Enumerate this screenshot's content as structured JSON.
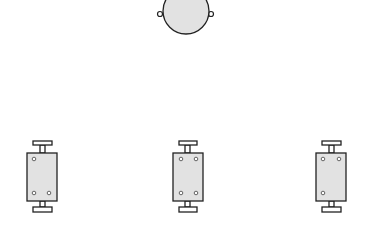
{
  "canvas": {
    "width": 371,
    "height": 227,
    "background": "#ffffff"
  },
  "colors": {
    "stroke": "#222222",
    "fill": "#e2e2e2",
    "hole_fill": "#ffffff"
  },
  "round_component": {
    "icon": "round-fixture-icon",
    "cx": 186,
    "cy": 11,
    "r": 23,
    "knobs": [
      {
        "cx": 160,
        "cy": 14,
        "r": 2.5
      },
      {
        "cx": 211,
        "cy": 14,
        "r": 2.5
      }
    ]
  },
  "rect_components": [
    {
      "icon": "rect-fixture-icon",
      "body": {
        "x": 27,
        "y": 153,
        "w": 30,
        "h": 48
      },
      "cap_top": {
        "x": 33,
        "y": 141,
        "w": 19,
        "h": 4
      },
      "cap_bottom": {
        "x": 33,
        "y": 207,
        "w": 19,
        "h": 5
      },
      "stem_x": 40,
      "stem_w": 5,
      "holes": [
        {
          "cx": 34,
          "cy": 159
        },
        {
          "cx": 34,
          "cy": 193
        },
        {
          "cx": 49,
          "cy": 193
        }
      ]
    },
    {
      "icon": "rect-fixture-icon",
      "body": {
        "x": 173,
        "y": 153,
        "w": 30,
        "h": 48
      },
      "cap_top": {
        "x": 179,
        "y": 141,
        "w": 18,
        "h": 4
      },
      "cap_bottom": {
        "x": 179,
        "y": 207,
        "w": 18,
        "h": 5
      },
      "stem_x": 185,
      "stem_w": 5,
      "holes": [
        {
          "cx": 181,
          "cy": 159
        },
        {
          "cx": 196,
          "cy": 159
        },
        {
          "cx": 181,
          "cy": 193
        },
        {
          "cx": 196,
          "cy": 193
        }
      ]
    },
    {
      "icon": "rect-fixture-icon",
      "body": {
        "x": 316,
        "y": 153,
        "w": 30,
        "h": 48
      },
      "cap_top": {
        "x": 322,
        "y": 141,
        "w": 19,
        "h": 4
      },
      "cap_bottom": {
        "x": 322,
        "y": 207,
        "w": 19,
        "h": 5
      },
      "stem_x": 329,
      "stem_w": 5,
      "holes": [
        {
          "cx": 323,
          "cy": 159
        },
        {
          "cx": 339,
          "cy": 159
        },
        {
          "cx": 323,
          "cy": 193
        }
      ]
    }
  ]
}
